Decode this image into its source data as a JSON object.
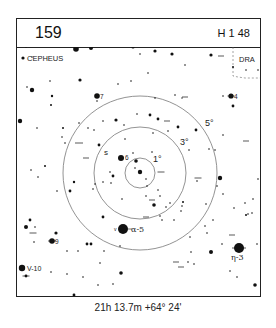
{
  "header": {
    "chart_number": "159",
    "chart_reference": "H 1 48"
  },
  "labels": {
    "constellation_main": "CEPHEUS",
    "constellation_neighbor": "DRA",
    "circle_1": "1°",
    "circle_3": "3°",
    "circle_5": "5°",
    "star_7": "7",
    "star_4": "4",
    "star_6": "6",
    "star_9": "9",
    "star_alpha": "α-5",
    "star_eta": "η-3",
    "star_v10": "V-10",
    "star_s": "s"
  },
  "footer": {
    "coordinates": "21h 13.7m  +64° 24'"
  },
  "colors": {
    "ink": "#111111",
    "circle": "#777777",
    "boundary": "#666666"
  },
  "map": {
    "center": [
      140,
      173
    ],
    "circle_radii": [
      15,
      46,
      77
    ],
    "stars": [
      [
        23,
        141,
        1.2
      ],
      [
        79,
        143,
        1.6
      ],
      [
        78,
        152,
        0.8
      ],
      [
        73,
        145,
        0.8
      ],
      [
        93,
        149,
        1.5
      ],
      [
        232,
        141,
        3.0
      ],
      [
        271,
        140,
        2.2
      ],
      [
        398,
        143,
        1.6
      ],
      [
        420,
        160,
        1.0
      ],
      [
        466,
        153,
        2.0
      ],
      [
        519,
        160,
        2.0
      ],
      [
        634,
        164,
        2.0
      ],
      [
        555,
        196,
        1.0
      ],
      [
        28,
        171,
        1.6
      ],
      [
        704,
        232,
        1.2
      ],
      [
        726,
        235,
        1.0
      ],
      [
        774,
        213,
        1.0
      ],
      [
        797,
        217,
        1.0
      ]
    ],
    "stars_abs": [
      {
        "x": 23,
        "y": 58,
        "r": 1.6
      },
      {
        "x": 26,
        "y": 47,
        "r": 0.8
      },
      {
        "x": 32,
        "y": 57,
        "r": 0.7
      },
      {
        "x": 76,
        "y": 49,
        "r": 2.8
      },
      {
        "x": 91,
        "y": 48,
        "r": 2.0
      },
      {
        "x": 133,
        "y": 47,
        "r": 1.6
      },
      {
        "x": 140,
        "y": 54,
        "r": 0.8
      },
      {
        "x": 155,
        "y": 51,
        "r": 1.6
      },
      {
        "x": 172,
        "y": 54,
        "r": 1.6
      },
      {
        "x": 211,
        "y": 55,
        "r": 1.6
      },
      {
        "x": 185,
        "y": 65,
        "r": 0.8
      },
      {
        "x": 233,
        "y": 67,
        "r": 1.0
      },
      {
        "x": 246,
        "y": 70,
        "r": 0.8
      },
      {
        "x": 258,
        "y": 70,
        "r": 0.8
      },
      {
        "x": 32,
        "y": 90,
        "r": 2.2
      },
      {
        "x": 27,
        "y": 87,
        "r": 0.8
      },
      {
        "x": 50,
        "y": 81,
        "r": 0.8
      },
      {
        "x": 80,
        "y": 80,
        "r": 1.6
      },
      {
        "x": 52,
        "y": 96,
        "r": 1.2
      },
      {
        "x": 51,
        "y": 105,
        "r": 1.0
      },
      {
        "x": 97,
        "y": 96,
        "r": 2.8
      },
      {
        "x": 97,
        "y": 101,
        "r": 0.8
      },
      {
        "x": 118,
        "y": 84,
        "r": 0.8
      },
      {
        "x": 131,
        "y": 81,
        "r": 0.8
      },
      {
        "x": 148,
        "y": 73,
        "r": 0.8
      },
      {
        "x": 155,
        "y": 98,
        "r": 0.8
      },
      {
        "x": 175,
        "y": 95,
        "r": 0.8
      },
      {
        "x": 150,
        "y": 115,
        "r": 1.4
      },
      {
        "x": 182,
        "y": 98,
        "r": 0.7
      },
      {
        "x": 223,
        "y": 96,
        "r": 0.8
      },
      {
        "x": 231,
        "y": 96,
        "r": 2.6
      },
      {
        "x": 233,
        "y": 106,
        "r": 1.4
      },
      {
        "x": 20,
        "y": 121,
        "r": 2.2
      },
      {
        "x": 37,
        "y": 128,
        "r": 0.8
      },
      {
        "x": 63,
        "y": 128,
        "r": 1.0
      },
      {
        "x": 79,
        "y": 123,
        "r": 0.8
      },
      {
        "x": 88,
        "y": 128,
        "r": 0.8
      },
      {
        "x": 103,
        "y": 121,
        "r": 0.8
      },
      {
        "x": 116,
        "y": 120,
        "r": 1.6
      },
      {
        "x": 124,
        "y": 125,
        "r": 0.8
      },
      {
        "x": 137,
        "y": 114,
        "r": 0.8
      },
      {
        "x": 158,
        "y": 119,
        "r": 1.4
      },
      {
        "x": 178,
        "y": 127,
        "r": 1.4
      },
      {
        "x": 196,
        "y": 130,
        "r": 1.4
      },
      {
        "x": 223,
        "y": 135,
        "r": 0.8
      },
      {
        "x": 62,
        "y": 137,
        "r": 0.8
      },
      {
        "x": 65,
        "y": 143,
        "r": 0.8
      },
      {
        "x": 94,
        "y": 130,
        "r": 0.8
      },
      {
        "x": 125,
        "y": 139,
        "r": 0.8
      },
      {
        "x": 133,
        "y": 153,
        "r": 0.8
      },
      {
        "x": 153,
        "y": 133,
        "r": 0.8
      },
      {
        "x": 168,
        "y": 131,
        "r": 0.8
      },
      {
        "x": 189,
        "y": 150,
        "r": 0.8
      },
      {
        "x": 99,
        "y": 145,
        "r": 1.4
      },
      {
        "x": 152,
        "y": 152,
        "r": 0.8
      },
      {
        "x": 209,
        "y": 149,
        "r": 0.8
      },
      {
        "x": 215,
        "y": 150,
        "r": 0.8
      },
      {
        "x": 121,
        "y": 158,
        "r": 3.0
      },
      {
        "x": 136,
        "y": 161,
        "r": 1.8
      },
      {
        "x": 135,
        "y": 168,
        "r": 0.8
      },
      {
        "x": 140,
        "y": 172,
        "r": 2.2
      },
      {
        "x": 146,
        "y": 179,
        "r": 0.8
      },
      {
        "x": 110,
        "y": 172,
        "r": 0.8
      },
      {
        "x": 113,
        "y": 176,
        "r": 1.4
      },
      {
        "x": 111,
        "y": 183,
        "r": 0.8
      },
      {
        "x": 103,
        "y": 182,
        "r": 0.8
      },
      {
        "x": 93,
        "y": 189,
        "r": 0.8
      },
      {
        "x": 95,
        "y": 184,
        "r": 0.8
      },
      {
        "x": 74,
        "y": 182,
        "r": 1.2
      },
      {
        "x": 70,
        "y": 191,
        "r": 1.4
      },
      {
        "x": 57,
        "y": 191,
        "r": 0.8
      },
      {
        "x": 31,
        "y": 170,
        "r": 0.8
      },
      {
        "x": 38,
        "y": 177,
        "r": 0.8
      },
      {
        "x": 45,
        "y": 166,
        "r": 1.0
      },
      {
        "x": 197,
        "y": 181,
        "r": 0.8
      },
      {
        "x": 147,
        "y": 186,
        "r": 0.8
      },
      {
        "x": 158,
        "y": 190,
        "r": 0.8
      },
      {
        "x": 146,
        "y": 196,
        "r": 0.8
      },
      {
        "x": 160,
        "y": 196,
        "r": 0.8
      },
      {
        "x": 122,
        "y": 199,
        "r": 0.8
      },
      {
        "x": 154,
        "y": 205,
        "r": 1.8
      },
      {
        "x": 166,
        "y": 207,
        "r": 0.8
      },
      {
        "x": 170,
        "y": 203,
        "r": 0.8
      },
      {
        "x": 181,
        "y": 211,
        "r": 0.8
      },
      {
        "x": 183,
        "y": 202,
        "r": 1.0
      },
      {
        "x": 206,
        "y": 204,
        "r": 0.8
      },
      {
        "x": 220,
        "y": 178,
        "r": 2.2
      },
      {
        "x": 217,
        "y": 186,
        "r": 0.8
      },
      {
        "x": 223,
        "y": 194,
        "r": 0.8
      },
      {
        "x": 234,
        "y": 208,
        "r": 0.8
      },
      {
        "x": 258,
        "y": 179,
        "r": 0.8
      },
      {
        "x": 253,
        "y": 199,
        "r": 0.8
      },
      {
        "x": 252,
        "y": 213,
        "r": 0.8
      },
      {
        "x": 245,
        "y": 203,
        "r": 0.8
      },
      {
        "x": 246,
        "y": 215,
        "r": 1.0
      },
      {
        "x": 103,
        "y": 217,
        "r": 1.4
      },
      {
        "x": 160,
        "y": 216,
        "r": 0.8
      },
      {
        "x": 162,
        "y": 220,
        "r": 0.8
      },
      {
        "x": 174,
        "y": 220,
        "r": 0.8
      },
      {
        "x": 182,
        "y": 206,
        "r": 0.8
      },
      {
        "x": 123,
        "y": 229,
        "r": 5.0
      },
      {
        "x": 30,
        "y": 220,
        "r": 1.4
      },
      {
        "x": 26,
        "y": 227,
        "r": 2.0
      },
      {
        "x": 35,
        "y": 227,
        "r": 0.8
      },
      {
        "x": 56,
        "y": 233,
        "r": 1.6
      },
      {
        "x": 52,
        "y": 241,
        "r": 2.8
      },
      {
        "x": 34,
        "y": 242,
        "r": 0.8
      },
      {
        "x": 87,
        "y": 244,
        "r": 1.4
      },
      {
        "x": 91,
        "y": 244,
        "r": 1.4
      },
      {
        "x": 67,
        "y": 251,
        "r": 0.8
      },
      {
        "x": 78,
        "y": 251,
        "r": 0.8
      },
      {
        "x": 104,
        "y": 251,
        "r": 0.8
      },
      {
        "x": 120,
        "y": 246,
        "r": 0.8
      },
      {
        "x": 190,
        "y": 237,
        "r": 0.8
      },
      {
        "x": 213,
        "y": 220,
        "r": 0.8
      },
      {
        "x": 205,
        "y": 226,
        "r": 0.8
      },
      {
        "x": 207,
        "y": 233,
        "r": 0.8
      },
      {
        "x": 222,
        "y": 244,
        "r": 0.8
      },
      {
        "x": 211,
        "y": 252,
        "r": 2.0
      },
      {
        "x": 191,
        "y": 252,
        "r": 0.8
      },
      {
        "x": 188,
        "y": 262,
        "r": 0.8
      },
      {
        "x": 194,
        "y": 264,
        "r": 0.8
      },
      {
        "x": 248,
        "y": 214,
        "r": 0.8
      },
      {
        "x": 240,
        "y": 250,
        "r": 0.8
      },
      {
        "x": 257,
        "y": 244,
        "r": 0.8
      },
      {
        "x": 22,
        "y": 268,
        "r": 3.2
      },
      {
        "x": 26,
        "y": 276,
        "r": 1.4
      },
      {
        "x": 51,
        "y": 272,
        "r": 0.8
      },
      {
        "x": 67,
        "y": 274,
        "r": 0.8
      },
      {
        "x": 83,
        "y": 277,
        "r": 0.8
      },
      {
        "x": 100,
        "y": 263,
        "r": 0.8
      },
      {
        "x": 121,
        "y": 273,
        "r": 1.8
      },
      {
        "x": 98,
        "y": 285,
        "r": 0.8
      },
      {
        "x": 113,
        "y": 284,
        "r": 0.8
      },
      {
        "x": 74,
        "y": 295,
        "r": 1.4
      },
      {
        "x": 78,
        "y": 298,
        "r": 0.8
      },
      {
        "x": 63,
        "y": 298,
        "r": 0.8
      },
      {
        "x": 230,
        "y": 271,
        "r": 0.8
      },
      {
        "x": 255,
        "y": 285,
        "r": 1.8
      },
      {
        "x": 237,
        "y": 277,
        "r": 0.8
      },
      {
        "x": 239,
        "y": 248,
        "r": 5.0
      }
    ],
    "bar_stars": [
      {
        "x": 79,
        "y": 143,
        "w": 8
      },
      {
        "x": 231,
        "y": 96,
        "w": 7
      },
      {
        "x": 246,
        "y": 141,
        "w": 6
      },
      {
        "x": 198,
        "y": 178,
        "w": 7
      },
      {
        "x": 161,
        "y": 172,
        "w": 7
      },
      {
        "x": 52,
        "y": 241,
        "w": 8
      },
      {
        "x": 33,
        "y": 233,
        "w": 7
      },
      {
        "x": 26,
        "y": 276,
        "w": 7
      },
      {
        "x": 239,
        "y": 248,
        "w": 14
      },
      {
        "x": 152,
        "y": 200,
        "w": 6
      },
      {
        "x": 176,
        "y": 262,
        "w": 6
      },
      {
        "x": 181,
        "y": 267,
        "w": 6
      },
      {
        "x": 146,
        "y": 217,
        "w": 6
      },
      {
        "x": 185,
        "y": 97,
        "w": 6
      },
      {
        "x": 167,
        "y": 121,
        "w": 6
      },
      {
        "x": 221,
        "y": 56,
        "w": 6
      },
      {
        "x": 86,
        "y": 158,
        "w": 6
      },
      {
        "x": 232,
        "y": 235,
        "w": 6
      }
    ]
  }
}
